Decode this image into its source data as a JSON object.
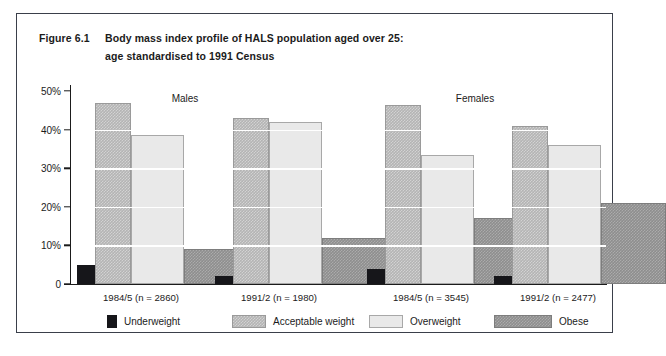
{
  "figure": {
    "number": "Figure 6.1",
    "title_line1": "Body mass index profile of HALS population aged over 25:",
    "title_line2": "age standardised to 1991 Census"
  },
  "legend": {
    "items": [
      {
        "label": "Underweight",
        "key": "underweight",
        "color": "#16161a"
      },
      {
        "label": "Acceptable weight",
        "key": "acceptable",
        "color": "#b4b4b4"
      },
      {
        "label": "Overweight",
        "key": "overweight",
        "color": "#e9e9e9"
      },
      {
        "label": "Obese",
        "key": "obese",
        "color": "#8e8e8e"
      }
    ]
  },
  "panels": [
    {
      "label": "Males"
    },
    {
      "label": "Females"
    }
  ],
  "axis": {
    "y_ticks": [
      "0",
      "10%",
      "20%",
      "30%",
      "40%",
      "50%"
    ]
  },
  "chart_data": {
    "type": "bar",
    "title": "Body mass index profile of HALS population aged over 25: age standardised to 1991 Census",
    "xlabel": "",
    "ylabel": "",
    "ylim": [
      0,
      50
    ],
    "yticks": [
      0,
      10,
      20,
      30,
      40,
      50
    ],
    "ytick_labels": [
      "0",
      "10%",
      "20%",
      "30%",
      "40%",
      "50%"
    ],
    "grid": true,
    "grid_color": "#ffffff",
    "legend_position": "bottom",
    "panels": [
      "Males",
      "Females"
    ],
    "categories": [
      "1984/5 (n = 2860)",
      "1991/2 (n = 1980)",
      "1984/5 (n = 3545)",
      "1991/2 (n = 2477)"
    ],
    "category_panel": [
      "Males",
      "Males",
      "Females",
      "Females"
    ],
    "series": [
      {
        "name": "Underweight",
        "color": "#16161a",
        "values": [
          5.0,
          2.0,
          4.0,
          2.0
        ]
      },
      {
        "name": "Acceptable weight",
        "color": "#b4b4b4",
        "values": [
          47.0,
          43.0,
          46.5,
          41.0
        ]
      },
      {
        "name": "Overweight",
        "color": "#e9e9e9",
        "values": [
          38.5,
          42.0,
          33.5,
          36.0
        ]
      },
      {
        "name": "Obese",
        "color": "#8e8e8e",
        "values": [
          9.0,
          12.0,
          17.0,
          21.0
        ]
      }
    ]
  }
}
